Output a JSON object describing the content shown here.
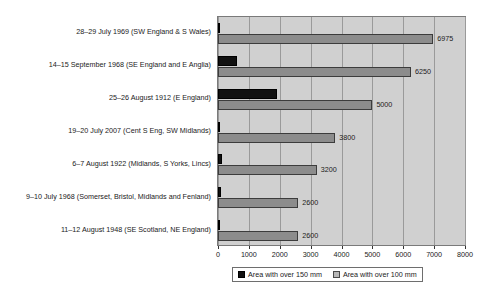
{
  "chart_data": {
    "type": "bar",
    "orientation": "horizontal",
    "title": "",
    "xlabel": "",
    "ylabel": "",
    "xlim": [
      0,
      8000
    ],
    "xticks": [
      0,
      1000,
      2000,
      3000,
      4000,
      5000,
      6000,
      7000,
      8000
    ],
    "xtick_labels": [
      "0",
      "1000",
      "2000",
      "3000",
      "4000",
      "5000",
      "6000",
      "7000",
      "8000"
    ],
    "grid": true,
    "grid_axis": "x",
    "legend_position": "bottom-center",
    "categories": [
      "28–29 July 1969 (SW England & S Wales)",
      "14–15 September 1968 (SE England and E Anglia)",
      "25–26 August 1912 (E England)",
      "19–20 July 2007 (Cent S Eng, SW Midlands)",
      "6–7 August 1922 (Midlands, S Yorks, Lincs)",
      "9–10 July 1968 (Somerset, Bristol, Midlands and Fenland)",
      "11–12 August 1948 (SE Scotland, NE England)"
    ],
    "series": [
      {
        "name": "Area with over 150 mm",
        "color": "#111111",
        "values": [
          40,
          620,
          1900,
          60,
          120,
          110,
          70
        ],
        "value_labels": [
          "",
          "",
          "",
          "",
          "",
          "",
          ""
        ]
      },
      {
        "name": "Area with over 100 mm",
        "color": "#8c8c8c",
        "values": [
          6975,
          6250,
          5000,
          3800,
          3200,
          2600,
          2600
        ],
        "value_labels": [
          "6975",
          "6250",
          "5000",
          "3800",
          "3200",
          "2600",
          "2600"
        ]
      }
    ]
  },
  "legend": {
    "items": [
      {
        "label": "Area with over 150 mm",
        "swatch": "black"
      },
      {
        "label": "Area with over 100 mm",
        "swatch": "gray"
      }
    ]
  },
  "colors": {
    "plot_background": "#d0d0d0",
    "gridline": "#9a9a9a",
    "axis": "#333333",
    "series_150mm": "#111111",
    "series_100mm": "#8c8c8c",
    "text": "#1a1a1a"
  }
}
